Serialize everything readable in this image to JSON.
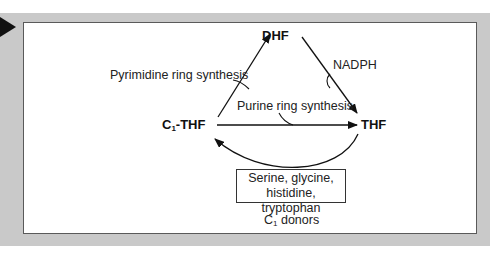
{
  "figure": {
    "nodes": {
      "dhf": "DHF",
      "thf": "THF",
      "c1thf_prefix": "C",
      "c1thf_sub": "1",
      "c1thf_suffix": "-THF"
    },
    "labels": {
      "pyrimidine": "Pyrimidine ring synthesis",
      "purine": "Purine ring synthesis",
      "nadph": "NADPH",
      "donors_line1": "Serine, glycine,",
      "donors_line2": "histidine, tryptophan",
      "c1_donors_prefix": "C",
      "c1_donors_sub": "1",
      "c1_donors_suffix": " donors"
    },
    "edges": [
      {
        "from": "C1-THF",
        "to": "DHF",
        "label": "Pyrimidine ring synthesis"
      },
      {
        "from": "DHF",
        "to": "THF",
        "label": "NADPH"
      },
      {
        "from": "C1-THF",
        "to": "THF",
        "label": "Purine ring synthesis"
      },
      {
        "from": "THF",
        "to": "C1-THF",
        "label": "Serine, glycine, histidine, tryptophan (C1 donors)"
      }
    ],
    "colors": {
      "frame_band": "#c9c9c9",
      "panel_border": "#5a5a5a",
      "ink": "#111111"
    }
  }
}
